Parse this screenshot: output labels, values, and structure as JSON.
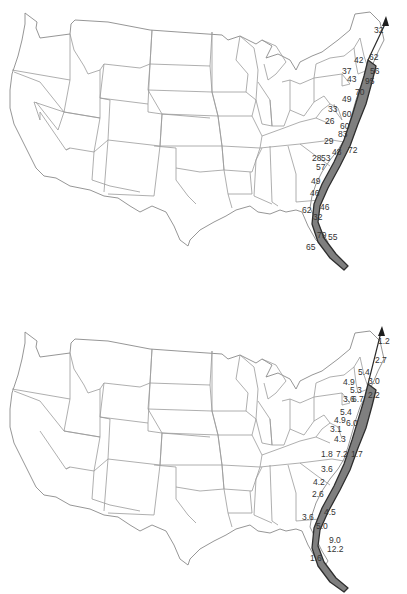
{
  "figure": {
    "panels": [
      {
        "id": "top",
        "description": "Map of contiguous United States with gray swath along Atlantic coast",
        "labels": [
          {
            "text": "32",
            "x": 379,
            "y": 31
          },
          {
            "text": "42",
            "x": 359,
            "y": 61
          },
          {
            "text": "62",
            "x": 374,
            "y": 58
          },
          {
            "text": "37",
            "x": 347,
            "y": 72
          },
          {
            "text": "56",
            "x": 375,
            "y": 72
          },
          {
            "text": "43",
            "x": 352,
            "y": 80
          },
          {
            "text": "95",
            "x": 370,
            "y": 82
          },
          {
            "text": "70",
            "x": 360,
            "y": 93
          },
          {
            "text": "49",
            "x": 347,
            "y": 100
          },
          {
            "text": "33",
            "x": 333,
            "y": 110
          },
          {
            "text": "60",
            "x": 347,
            "y": 115
          },
          {
            "text": "26",
            "x": 330,
            "y": 122
          },
          {
            "text": "60",
            "x": 345,
            "y": 127
          },
          {
            "text": "83",
            "x": 343,
            "y": 135
          },
          {
            "text": "29",
            "x": 329,
            "y": 142
          },
          {
            "text": "72",
            "x": 353,
            "y": 151
          },
          {
            "text": "48",
            "x": 337,
            "y": 153
          },
          {
            "text": "28",
            "x": 317,
            "y": 159
          },
          {
            "text": "53",
            "x": 326,
            "y": 159
          },
          {
            "text": "57",
            "x": 321,
            "y": 168
          },
          {
            "text": "49",
            "x": 316,
            "y": 182
          },
          {
            "text": "46",
            "x": 315,
            "y": 194
          },
          {
            "text": "46",
            "x": 325,
            "y": 208
          },
          {
            "text": "62",
            "x": 307,
            "y": 211
          },
          {
            "text": "32",
            "x": 318,
            "y": 218
          },
          {
            "text": "79",
            "x": 322,
            "y": 236
          },
          {
            "text": "55",
            "x": 333,
            "y": 238
          },
          {
            "text": "65",
            "x": 311,
            "y": 248
          }
        ]
      },
      {
        "id": "bottom",
        "description": "Map of contiguous United States with gray swath along Atlantic coast",
        "labels": [
          {
            "text": "1.2",
            "x": 383,
            "y": 342
          },
          {
            "text": "2.7",
            "x": 380,
            "y": 361
          },
          {
            "text": "5.4",
            "x": 363,
            "y": 373
          },
          {
            "text": "4.9",
            "x": 348,
            "y": 383
          },
          {
            "text": "3.0",
            "x": 373,
            "y": 382
          },
          {
            "text": "5.3",
            "x": 355,
            "y": 391
          },
          {
            "text": "2.2",
            "x": 373,
            "y": 396
          },
          {
            "text": "3.6",
            "x": 348,
            "y": 400
          },
          {
            "text": "6.7",
            "x": 357,
            "y": 400
          },
          {
            "text": "5.4",
            "x": 345,
            "y": 413
          },
          {
            "text": "4.9",
            "x": 339,
            "y": 421
          },
          {
            "text": "6.0",
            "x": 351,
            "y": 424
          },
          {
            "text": "3.1",
            "x": 335,
            "y": 430
          },
          {
            "text": "4.3",
            "x": 339,
            "y": 440
          },
          {
            "text": "1.8",
            "x": 326,
            "y": 455
          },
          {
            "text": "7.2",
            "x": 341,
            "y": 455
          },
          {
            "text": "1.7",
            "x": 356,
            "y": 455
          },
          {
            "text": "3.6",
            "x": 326,
            "y": 470
          },
          {
            "text": "4.2",
            "x": 318,
            "y": 483
          },
          {
            "text": "2.6",
            "x": 317,
            "y": 495
          },
          {
            "text": "4.5",
            "x": 329,
            "y": 513
          },
          {
            "text": "3.6",
            "x": 307,
            "y": 518
          },
          {
            "text": "5.0",
            "x": 321,
            "y": 527
          },
          {
            "text": "9.0",
            "x": 334,
            "y": 541
          },
          {
            "text": "12.2",
            "x": 332,
            "y": 550
          },
          {
            "text": "1.6",
            "x": 315,
            "y": 559
          }
        ]
      }
    ]
  },
  "colors": {
    "background": "#ffffff",
    "state_borders": "#9a9a9a",
    "swath_fill": "#7f7f7f",
    "swath_outline": "#2e2e2e",
    "label_text": "#333333"
  },
  "icons": {
    "track_arrow": "arrowhead-north"
  }
}
